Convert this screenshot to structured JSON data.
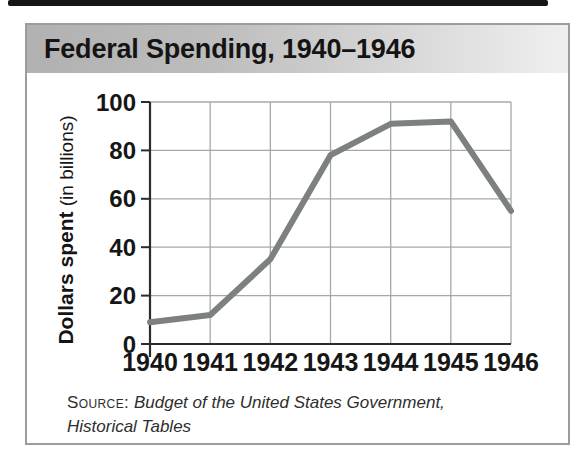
{
  "page": {
    "top_rule_color": "#161616",
    "background": "#ffffff"
  },
  "card": {
    "title": "Federal Spending, 1940–1946",
    "title_bar_gradient_left": "#b1b1b1",
    "title_bar_gradient_right": "#efefef",
    "border_color": "#9c9c9c"
  },
  "chart_data": {
    "type": "line",
    "title": "Federal Spending, 1940–1946",
    "categories": [
      "1940",
      "1941",
      "1942",
      "1943",
      "1944",
      "1945",
      "1946"
    ],
    "values": [
      9,
      12,
      35,
      78,
      91,
      92,
      55
    ],
    "xlabel": "",
    "ylabel_bold": "Dollars spent",
    "ylabel_regular": "(in billions)",
    "y_ticks": [
      0,
      20,
      40,
      60,
      80,
      100
    ],
    "ylim": [
      0,
      100
    ],
    "grid": true,
    "legend": "none",
    "line_color": "#7d8081",
    "axis_color": "#2b2b2b",
    "grid_color": "#a8a8a8",
    "tick_label_color": "#161616"
  },
  "source": {
    "label": "Source:",
    "line1": "Budget of the United States Government,",
    "line2": "Historical Tables"
  }
}
